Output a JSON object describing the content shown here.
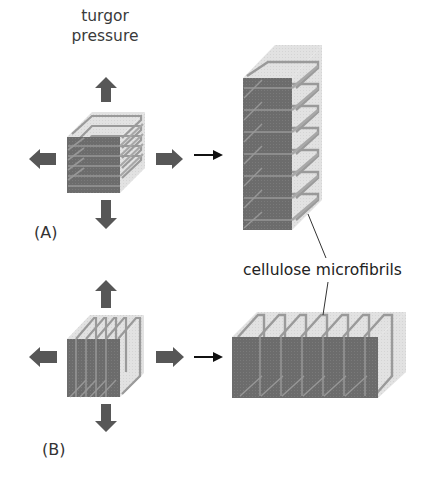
{
  "figure": {
    "force_label": "turgor\npressure",
    "force_label_lines": [
      "turgor",
      "pressure"
    ],
    "panel_a_label": "(A)",
    "panel_b_label": "(B)",
    "callout_label": "cellulose microfibrils",
    "colors": {
      "front_face": "#6e6e6e",
      "translucent_face": "#e3e3e3",
      "microfibril": "#9a9a9a",
      "force_arrow": "#575757",
      "transition_arrow": "#111111",
      "text": "#333333"
    },
    "panels": [
      {
        "id": "A",
        "description": "Cube with horizontal microfibril hoops; turgor pressure pushes outward in all directions; cell elongates vertically",
        "hoop_orientation": "horizontal",
        "initial_hoops": 5,
        "result_hoops": 7,
        "result_shape": "tall column"
      },
      {
        "id": "B",
        "description": "Cube with vertical microfibril hoops; turgor pressure pushes outward; cell elongates horizontally",
        "hoop_orientation": "vertical",
        "initial_hoops": 5,
        "result_hoops": 7,
        "result_shape": "wide slab"
      }
    ]
  }
}
